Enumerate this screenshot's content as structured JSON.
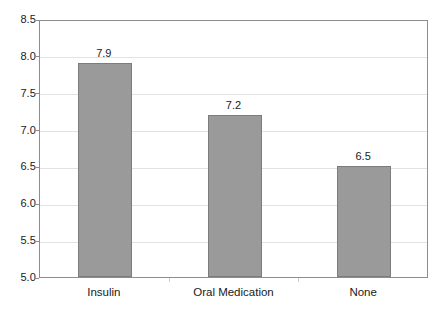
{
  "chart_data": {
    "type": "bar",
    "title": "",
    "subtitle": "",
    "xlabel": "",
    "ylabel": "",
    "categories": [
      "Insulin",
      "Oral Medication",
      "None"
    ],
    "values": [
      7.9,
      7.2,
      6.5
    ],
    "data_labels": [
      "7.9",
      "7.2",
      "6.5"
    ],
    "ylim": [
      5.0,
      8.5
    ],
    "ytick_values": [
      8.5,
      8.0,
      7.5,
      7.0,
      6.5,
      6.0,
      5.5,
      5.0
    ],
    "ytick_labels": [
      "8.5",
      "8.0",
      "7.5",
      "7.0",
      "6.5",
      "6.0",
      "5.5",
      "5.0"
    ],
    "grid": true,
    "grid_axis": "y",
    "legend": false,
    "legend_position": "none",
    "bar_color": "#9a9a9a",
    "bar_edge_color": "#7c7c7c",
    "grid_color": "#e2e2e2",
    "axis_color": "#8d8d8d",
    "text_color": "#1a1a1a",
    "background_color": "#ffffff"
  }
}
